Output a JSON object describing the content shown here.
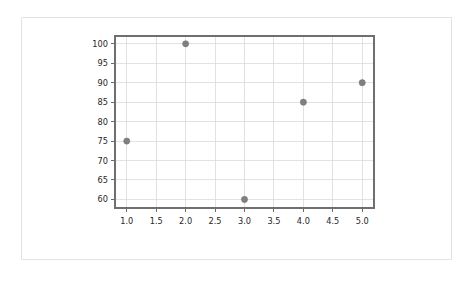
{
  "chart_data": {
    "type": "scatter",
    "title": "",
    "xlabel": "",
    "ylabel": "",
    "x": [
      1,
      2,
      3,
      4,
      5
    ],
    "values": [
      75,
      100,
      60,
      85,
      90
    ],
    "points": [
      {
        "x": 1,
        "y": 75
      },
      {
        "x": 2,
        "y": 100
      },
      {
        "x": 3,
        "y": 60
      },
      {
        "x": 4,
        "y": 85
      },
      {
        "x": 5,
        "y": 90
      }
    ],
    "xlim": [
      0.8,
      5.2
    ],
    "ylim": [
      57.8,
      102.0
    ],
    "xticks": [
      1.0,
      1.5,
      2.0,
      2.5,
      3.0,
      3.5,
      4.0,
      4.5,
      5.0
    ],
    "xtick_labels": [
      "1.0",
      "1.5",
      "2.0",
      "2.5",
      "3.0",
      "3.5",
      "4.0",
      "4.5",
      "5.0"
    ],
    "yticks": [
      60,
      65,
      70,
      75,
      80,
      85,
      90,
      95,
      100
    ],
    "ytick_labels": [
      "60",
      "65",
      "70",
      "75",
      "80",
      "85",
      "90",
      "95",
      "100"
    ],
    "grid": true,
    "legend": null,
    "marker_color": "#808080",
    "grid_color": "#d6d6d6",
    "axis_color": "#6f6f6f",
    "tick_label_color": "#262626",
    "background_color": "#ffffff",
    "card_border_color": "#e2e2e2"
  }
}
